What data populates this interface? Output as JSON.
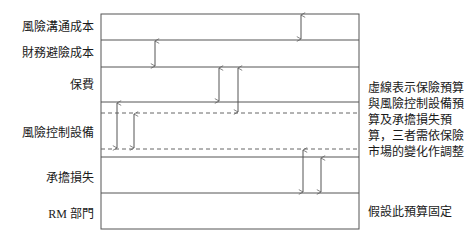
{
  "diagram": {
    "title": "",
    "rows": [
      {
        "id": "risk-communication",
        "label": "風險溝通成本"
      },
      {
        "id": "financial-hedging",
        "label": "財務避險成本"
      },
      {
        "id": "premium",
        "label": "保費"
      },
      {
        "id": "risk-control-equipment",
        "label": "風險控制設備"
      },
      {
        "id": "retained-loss",
        "label": "承擔損失"
      },
      {
        "id": "rm-department",
        "label": "RM 部門"
      }
    ],
    "notes": {
      "variable": "虛線表示保險預算與風險控制設備預算及承擔損失預算，三者需依保險市場的變化作調整",
      "fixed": "假設此預算固定"
    },
    "colors": {
      "line": "#555555",
      "dashed": "#666666",
      "text": "#1a1a1a"
    }
  }
}
